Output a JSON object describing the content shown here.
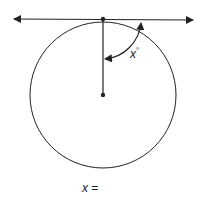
{
  "diagram": {
    "type": "circle-tangent-radius-angle",
    "angle_label": {
      "variable": "x",
      "unit": "°"
    },
    "answer_prompt": {
      "variable": "x",
      "equals": "="
    },
    "colors": {
      "stroke": "#222222",
      "background": "#ffffff"
    }
  }
}
